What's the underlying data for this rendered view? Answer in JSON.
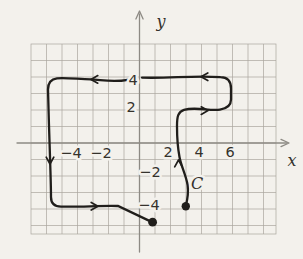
{
  "figure": {
    "colors": {
      "paper": "#f3f1ec",
      "grid": "#a9a59e",
      "axis": "#8d8a84",
      "curve": "#201e1b",
      "text": "#35322c"
    },
    "x_axis_label": "x",
    "y_axis_label": "y",
    "curve_label": {
      "text": "C",
      "x": 197,
      "y": 183
    },
    "x_ticks": [
      {
        "label": "−4",
        "value": -4,
        "x": 71,
        "y": 153
      },
      {
        "label": "−2",
        "value": -2,
        "x": 101,
        "y": 153
      },
      {
        "label": "2",
        "value": 2,
        "x": 168,
        "y": 152
      },
      {
        "label": "4",
        "value": 4,
        "x": 199,
        "y": 152
      },
      {
        "label": "6",
        "value": 6,
        "x": 230,
        "y": 152
      }
    ],
    "y_ticks": [
      {
        "label": "4",
        "value": 4,
        "x": 133,
        "y": 80
      },
      {
        "label": "2",
        "value": 2,
        "x": 131,
        "y": 107
      },
      {
        "label": "−2",
        "value": -2,
        "x": 150,
        "y": 172
      },
      {
        "label": "−4",
        "value": -4,
        "x": 149,
        "y": 205
      }
    ],
    "curve_path": "M185.8,206 C187.8,198 188.6,192 187.6,185 C186,175 181,166 179.5,157 C177.6,147 177,137 177,126 C177,117 178,111.6 184,109.8 C196,106.6 210,111.2 220,109.6 C227,108.5 231,105.5 231,99.5 L231,88.5 C231,81 227.5,77.3 220.5,77.2 C194,75.4 168,78.6 142,77.6 M127.5,79.8 C113,82.8 101,79.7 91,79.4 C77,79 65,77.6 57,78.4 C50.5,79.2 48,83 48,89.5 C48.5,113 49.5,140 50.2,163 C50.6,177 51,188 51,197 C51,203.2 54.5,206.6 61,206.6 C80,207.2 99,205.5 118,206 L151,221.6",
    "dots": [
      {
        "x": 152.6,
        "y": 222.2,
        "r": 4.4
      },
      {
        "x": 185.8,
        "y": 206.2,
        "r": 4.2
      }
    ],
    "curve_arrows": [
      {
        "x": 178.5,
        "y": 160,
        "dir": "up"
      },
      {
        "x": 208,
        "y": 110.6,
        "dir": "right"
      },
      {
        "x": 201,
        "y": 76.8,
        "dir": "left"
      },
      {
        "x": 91,
        "y": 79.4,
        "dir": "left"
      },
      {
        "x": 50,
        "y": 164,
        "dir": "down"
      },
      {
        "x": 98,
        "y": 206.2,
        "dir": "right"
      }
    ]
  }
}
